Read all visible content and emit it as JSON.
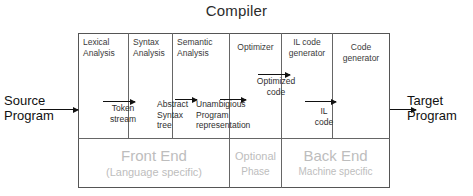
{
  "title": "Compiler",
  "diagram": {
    "type": "block-flow",
    "phases": [
      {
        "id": "lexical-analysis",
        "line1": "Lexical",
        "line2": "Analysis"
      },
      {
        "id": "syntax-analysis",
        "line1": "Syntax",
        "line2": "Analysis"
      },
      {
        "id": "semantic-analysis",
        "line1": "Semantic",
        "line2": "Analysis"
      },
      {
        "id": "optimizer",
        "line1": "Optimizer",
        "line2": ""
      },
      {
        "id": "il-code-generator",
        "line1": "IL code",
        "line2": "generator"
      },
      {
        "id": "code-generator",
        "line1": "Code",
        "line2": "generator"
      }
    ],
    "intermediates": [
      {
        "id": "token-stream",
        "line1": "Token",
        "line2": "stream",
        "line3": ""
      },
      {
        "id": "abstract-syntax-tree",
        "line1": "Abstract",
        "line2": "Syntax",
        "line3": "tree"
      },
      {
        "id": "unambigious-program-representation",
        "line1": "Unambigious",
        "line2": "Program",
        "line3": "representation"
      },
      {
        "id": "optimized-code",
        "line1": "Optimized",
        "line2": "code",
        "line3": ""
      },
      {
        "id": "il-code",
        "line1": "IL",
        "line2": "code",
        "line3": ""
      }
    ],
    "bands": [
      {
        "id": "front-end",
        "big": "Front End",
        "small": "(Language specific)"
      },
      {
        "id": "optional-phase",
        "big": "Optional",
        "small": "Phase"
      },
      {
        "id": "back-end",
        "big": "Back End",
        "small": "Machine specific"
      }
    ],
    "endpoints": {
      "input_line1": "Source",
      "input_line2": "Program",
      "output_line1": "Target",
      "output_line2": "Program"
    }
  },
  "colors": {
    "ink": "#1a1a1a",
    "border": "#666666",
    "band_text": "#bdbdbd",
    "background": "#ffffff"
  }
}
